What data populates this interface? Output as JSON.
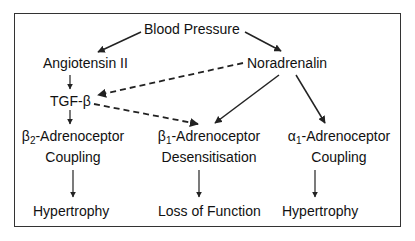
{
  "diagram": {
    "type": "flowchart",
    "nodes": {
      "blood_pressure": "Blood Pressure",
      "angiotensin": "Angiotensin II",
      "noradrenalin": "Noradrenalin",
      "tgf": "TGF-β",
      "beta2": {
        "greek": "β",
        "sub": "2",
        "rest": "-Adrenoceptor",
        "line2": "Coupling"
      },
      "beta1": {
        "greek": "β",
        "sub": "1",
        "rest": "-Adrenoceptor",
        "line2": "Desensitisation"
      },
      "alpha1": {
        "greek": "α",
        "sub": "1",
        "rest": "-Adrenoceptor",
        "line2": "Coupling"
      },
      "outcome_left": "Hypertrophy",
      "outcome_middle": "Loss of Function",
      "outcome_right": "Hypertrophy"
    },
    "edges": [
      {
        "from": "Blood Pressure",
        "to": "Angiotensin II",
        "style": "solid"
      },
      {
        "from": "Blood Pressure",
        "to": "Noradrenalin",
        "style": "solid"
      },
      {
        "from": "Angiotensin II",
        "to": "TGF-β",
        "style": "solid"
      },
      {
        "from": "Noradrenalin",
        "to": "TGF-β",
        "style": "dashed"
      },
      {
        "from": "TGF-β",
        "to": "β2-Adrenoceptor Coupling",
        "style": "solid"
      },
      {
        "from": "TGF-β",
        "to": "β1-Adrenoceptor Desensitisation",
        "style": "dashed"
      },
      {
        "from": "Noradrenalin",
        "to": "β1-Adrenoceptor Desensitisation",
        "style": "solid"
      },
      {
        "from": "Noradrenalin",
        "to": "α1-Adrenoceptor Coupling",
        "style": "solid"
      },
      {
        "from": "β2-Adrenoceptor Coupling",
        "to": "Hypertrophy",
        "style": "solid"
      },
      {
        "from": "β1-Adrenoceptor Desensitisation",
        "to": "Loss of Function",
        "style": "solid"
      },
      {
        "from": "α1-Adrenoceptor Coupling",
        "to": "Hypertrophy",
        "style": "solid"
      }
    ],
    "colors": {
      "line": "#222222",
      "border": "#333333",
      "text": "#111111"
    }
  }
}
